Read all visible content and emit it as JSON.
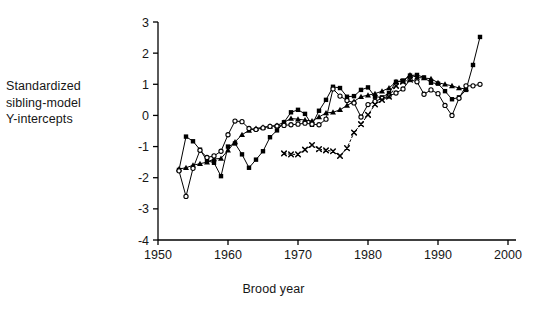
{
  "chart_data": {
    "type": "line",
    "title": "",
    "xlabel": "Brood year",
    "ylabel": "Standardized sibling-model Y-intercepts",
    "xlim": [
      1950,
      2000
    ],
    "ylim": [
      -4,
      3
    ],
    "xticks": [
      1950,
      1960,
      1970,
      1980,
      1990,
      2000
    ],
    "yticks": [
      3,
      2,
      1,
      0,
      -1,
      -2,
      -3,
      -4
    ],
    "grid": false,
    "legend": "none",
    "axis_color": "#000000",
    "series": [
      {
        "name": "stock-1",
        "marker": "filled-square",
        "line": "solid",
        "color": "#000000",
        "x": [
          1953,
          1954,
          1955,
          1956,
          1957,
          1958,
          1959,
          1960,
          1961,
          1962,
          1963,
          1964,
          1965,
          1966,
          1967,
          1968,
          1969,
          1970,
          1971,
          1972,
          1973,
          1974,
          1975,
          1976,
          1977,
          1978,
          1979,
          1980,
          1981,
          1982,
          1983,
          1984,
          1985,
          1986,
          1987,
          1988,
          1989,
          1990,
          1991,
          1992,
          1993,
          1994,
          1995,
          1996
        ],
        "y": [
          -1.75,
          -0.68,
          -0.83,
          -1.1,
          -1.45,
          -1.52,
          -1.95,
          -1.0,
          -0.9,
          -1.25,
          -1.68,
          -1.42,
          -1.15,
          -0.7,
          -0.48,
          -0.22,
          0.1,
          0.18,
          0.05,
          -0.3,
          0.15,
          0.5,
          0.92,
          0.88,
          0.6,
          0.62,
          0.82,
          0.9,
          0.6,
          0.58,
          0.72,
          1.08,
          1.12,
          1.28,
          1.3,
          1.22,
          1.05,
          1.02,
          0.78,
          0.52,
          0.58,
          0.82,
          1.62,
          2.52
        ]
      },
      {
        "name": "stock-2",
        "marker": "filled-triangle",
        "line": "solid",
        "color": "#000000",
        "x": [
          1953,
          1954,
          1955,
          1956,
          1957,
          1958,
          1959,
          1960,
          1961,
          1962,
          1963,
          1964,
          1965,
          1966,
          1967,
          1968,
          1969,
          1970,
          1971,
          1972,
          1973,
          1974,
          1975,
          1976,
          1977,
          1978,
          1979,
          1980,
          1981,
          1982,
          1983,
          1984,
          1985,
          1986,
          1987,
          1988,
          1989,
          1990,
          1991,
          1992,
          1993,
          1994
        ],
        "y": [
          -1.72,
          -1.68,
          -1.6,
          -1.55,
          -1.5,
          -1.4,
          -1.38,
          -1.12,
          -0.85,
          -0.62,
          -0.48,
          -0.42,
          -0.38,
          -0.35,
          -0.32,
          -0.22,
          -0.1,
          -0.12,
          -0.15,
          -0.18,
          -0.05,
          0.08,
          0.1,
          0.18,
          0.32,
          0.45,
          0.6,
          0.65,
          0.7,
          0.78,
          0.88,
          1.08,
          1.1,
          1.3,
          1.22,
          1.2,
          1.18,
          1.05,
          1.0,
          0.95,
          0.88,
          0.85
        ]
      },
      {
        "name": "stock-3",
        "marker": "open-circle",
        "line": "solid",
        "color": "#000000",
        "x": [
          1953,
          1954,
          1955,
          1956,
          1957,
          1958,
          1959,
          1960,
          1961,
          1962,
          1963,
          1964,
          1965,
          1966,
          1967,
          1968,
          1969,
          1970,
          1971,
          1972,
          1973,
          1974,
          1975,
          1976,
          1977,
          1978,
          1979,
          1980,
          1981,
          1982,
          1983,
          1984,
          1985,
          1986,
          1987,
          1988,
          1989,
          1990,
          1991,
          1992,
          1993,
          1994,
          1995,
          1996
        ],
        "y": [
          -1.78,
          -2.6,
          -1.7,
          -1.12,
          -1.35,
          -1.3,
          -1.15,
          -0.62,
          -0.18,
          -0.2,
          -0.42,
          -0.45,
          -0.4,
          -0.35,
          -0.34,
          -0.32,
          -0.3,
          -0.28,
          -0.25,
          -0.28,
          -0.3,
          -0.12,
          0.85,
          0.62,
          0.48,
          0.4,
          -0.05,
          0.35,
          0.45,
          0.55,
          0.62,
          0.72,
          0.85,
          1.15,
          1.08,
          0.68,
          0.82,
          0.7,
          0.32,
          0.0,
          0.55,
          0.95,
          0.95,
          1.0
        ]
      },
      {
        "name": "stock-4",
        "marker": "x-cross",
        "line": "dotted",
        "color": "#000000",
        "x": [
          1968,
          1969,
          1970,
          1971,
          1972,
          1973,
          1974,
          1975,
          1976,
          1977,
          1978,
          1979,
          1980,
          1981,
          1982,
          1983,
          1984,
          1985,
          1986
        ],
        "y": [
          -1.22,
          -1.25,
          -1.25,
          -1.1,
          -0.95,
          -1.08,
          -1.12,
          -1.15,
          -1.3,
          -1.05,
          -0.55,
          -0.28,
          0.02,
          0.35,
          0.5,
          0.6,
          0.95,
          1.08,
          1.15
        ]
      }
    ]
  },
  "axis_labels": {
    "y_line1": "Standardized",
    "y_line2": "sibling-model",
    "y_line3": "Y-intercepts",
    "x_title": "Brood year"
  }
}
